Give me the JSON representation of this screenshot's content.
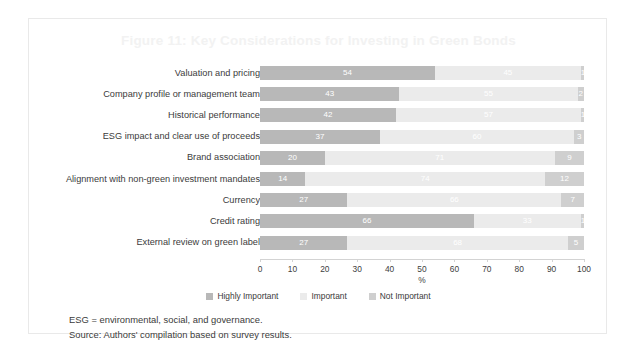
{
  "figure": {
    "title": "Figure 11: Key Considerations for Investing in Green Bonds",
    "notes": [
      "ESG = environmental, social, and governance.",
      "Source: Authors' compilation based on survey results."
    ]
  },
  "colors": {
    "highly_important": "#b8b8b8",
    "important": "#ebebeb",
    "not_important": "#cfcfcf",
    "title": "#f2f2f2",
    "text": "#3b3b3b",
    "border": "#e9e9e9"
  },
  "chart_data": {
    "type": "bar",
    "orientation": "horizontal",
    "stacked": true,
    "title": "Figure 11: Key Considerations for Investing in Green Bonds",
    "xlabel": "%",
    "ylabel": "",
    "xlim": [
      0,
      100
    ],
    "xticks": [
      0,
      10,
      20,
      30,
      40,
      50,
      60,
      70,
      80,
      90,
      100
    ],
    "xtick_labels": [
      "0",
      "10",
      "20",
      "30",
      "40",
      "50",
      "60",
      "70",
      "80",
      "90",
      "100"
    ],
    "grid": false,
    "legend_position": "bottom",
    "categories": [
      "Valuation and pricing",
      "Company profile or management team",
      "Historical performance",
      "ESG impact and clear use of proceeds",
      "Brand association",
      "Alignment with non-green investment mandates",
      "Currency",
      "Credit rating",
      "External review on green label"
    ],
    "series": [
      {
        "name": "Highly Important",
        "color": "#b8b8b8",
        "values": [
          54,
          43,
          42,
          37,
          20,
          14,
          27,
          66,
          27
        ]
      },
      {
        "name": "Important",
        "color": "#ebebeb",
        "values": [
          45,
          55,
          57,
          60,
          71,
          74,
          66,
          33,
          68
        ]
      },
      {
        "name": "Not Important",
        "color": "#cfcfcf",
        "values": [
          1,
          2,
          1,
          3,
          9,
          12,
          7,
          1,
          5
        ]
      }
    ]
  }
}
